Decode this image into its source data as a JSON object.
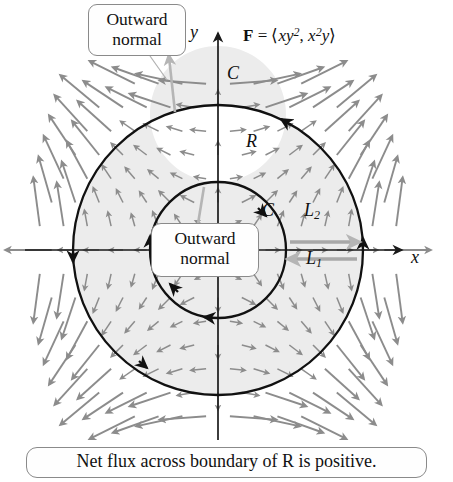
{
  "figure": {
    "title_callout": {
      "lines": [
        "Outward",
        "normal"
      ]
    },
    "inner_callout": {
      "lines": [
        "Outward",
        "normal"
      ]
    },
    "caption": "Net flux across boundary of R is positive.",
    "axes": {
      "x_label": "x",
      "y_label": "y",
      "origin": [
        218,
        250
      ],
      "x_range": [
        25,
        405
      ],
      "y_range": [
        30,
        440
      ]
    },
    "labels": {
      "field_formula_plain": "F = <xy2, x2y>",
      "field_bold": "F",
      "field_equals": "=",
      "field_open": "⟨",
      "field_term1_base": "xy",
      "field_term1_exp": "2",
      "field_comma": ",",
      "field_term2_base1": "x",
      "field_term2_exp": "2",
      "field_term2_base2": "y",
      "field_close": "⟩",
      "curve_outer": "C",
      "curve_inner": "C",
      "region": "R",
      "segment_upper_base": "L",
      "segment_upper_sub": "2",
      "segment_lower_base": "L",
      "segment_lower_sub": "1"
    },
    "geometry": {
      "outer_circle_radius": 145,
      "inner_circle_radius": 68,
      "outer_orientation": "counterclockwise",
      "inner_orientation": "clockwise",
      "annulus_fill": "#ececec",
      "curve_stroke": "#111111",
      "vector_color": "#8c8c8c",
      "normal_color": "#b5b5b5",
      "axis_color": "#1a1a1a",
      "background": "#ffffff"
    }
  },
  "chart_data": {
    "type": "scatter",
    "xlabel": "x",
    "ylabel": "y",
    "grid": false,
    "legend_position": "none",
    "xlim": [
      -2.7,
      2.7
    ],
    "ylim": [
      -2.7,
      2.7
    ],
    "field": {
      "fx": "x*y^2",
      "fy": "x^2*y",
      "description": "Arrows point radially outward away from the origin in every quadrant; magnitude grows with distance from origin."
    },
    "annotations": [
      {
        "text": "C",
        "role": "outer boundary curve",
        "x": 0.15,
        "y": 1.62
      },
      {
        "text": "C",
        "role": "inner boundary curve",
        "x": 0.78,
        "y": 0.83
      },
      {
        "text": "R",
        "role": "annular region",
        "x": 0.5,
        "y": 1.05
      },
      {
        "text": "L2",
        "role": "upper connecting segment",
        "x": 1.55,
        "y": 0.82
      },
      {
        "text": "L1",
        "role": "lower connecting segment",
        "x": 1.6,
        "y": -0.02
      },
      {
        "text": "Outward normal",
        "role": "outer normal callout",
        "x": -1.1,
        "y": 2.4
      },
      {
        "text": "Outward normal",
        "role": "inner normal callout",
        "x": 0.0,
        "y": -0.1
      }
    ],
    "shapes": [
      {
        "type": "circle",
        "cx": 0,
        "cy": 0,
        "r": 2.0,
        "orientation": "counterclockwise",
        "label": "C"
      },
      {
        "type": "circle",
        "cx": 0,
        "cy": 0,
        "r": 0.94,
        "orientation": "clockwise",
        "label": "C"
      }
    ]
  }
}
